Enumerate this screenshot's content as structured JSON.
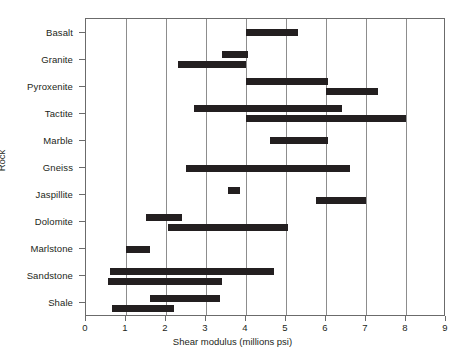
{
  "chart_data": {
    "type": "bar",
    "subtype": "range-bar",
    "orientation": "horizontal",
    "title": "",
    "xlabel": "Shear modulus (millions psi)",
    "ylabel": "Rock",
    "xlim": [
      0,
      9
    ],
    "xticks": [
      0,
      1,
      2,
      3,
      4,
      5,
      6,
      7,
      8,
      9
    ],
    "xtick_labels": [
      "0",
      "1",
      "2",
      "3",
      "4",
      "5",
      "6",
      "7",
      "8",
      "9"
    ],
    "grid": "vertical",
    "legend": "none",
    "bar_color": "#231f20",
    "axis_color": "#6b6b6b",
    "gridline_color": "#8d8d8d",
    "categories": [
      "Basalt",
      "Granite",
      "Pyroxenite",
      "Tactite",
      "Marble",
      "Gneiss",
      "Jaspillite",
      "Dolomite",
      "Marlstone",
      "Sandstone",
      "Shale"
    ],
    "ranges": [
      {
        "category": "Basalt",
        "bars": [
          {
            "start": 4.0,
            "end": 5.3
          }
        ]
      },
      {
        "category": "Granite",
        "bars": [
          {
            "start": 3.4,
            "end": 4.05
          },
          {
            "start": 2.3,
            "end": 4.0
          }
        ]
      },
      {
        "category": "Pyroxenite",
        "bars": [
          {
            "start": 4.0,
            "end": 6.05
          },
          {
            "start": 6.0,
            "end": 7.3
          }
        ]
      },
      {
        "category": "Tactite",
        "bars": [
          {
            "start": 2.7,
            "end": 6.4
          },
          {
            "start": 4.0,
            "end": 8.0
          }
        ]
      },
      {
        "category": "Marble",
        "bars": [
          {
            "start": 4.6,
            "end": 6.05
          }
        ]
      },
      {
        "category": "Gneiss",
        "bars": [
          {
            "start": 2.5,
            "end": 6.6
          }
        ]
      },
      {
        "category": "Jaspillite",
        "bars": [
          {
            "start": 3.55,
            "end": 3.85
          },
          {
            "start": 5.75,
            "end": 7.0
          }
        ]
      },
      {
        "category": "Dolomite",
        "bars": [
          {
            "start": 1.5,
            "end": 2.4
          },
          {
            "start": 2.05,
            "end": 5.05
          }
        ]
      },
      {
        "category": "Marlstone",
        "bars": [
          {
            "start": 1.0,
            "end": 1.6
          }
        ]
      },
      {
        "category": "Sandstone",
        "bars": [
          {
            "start": 0.6,
            "end": 4.7
          },
          {
            "start": 0.55,
            "end": 3.4
          }
        ]
      },
      {
        "category": "Shale",
        "bars": [
          {
            "start": 1.6,
            "end": 3.35
          },
          {
            "start": 0.65,
            "end": 2.2
          }
        ]
      }
    ]
  }
}
